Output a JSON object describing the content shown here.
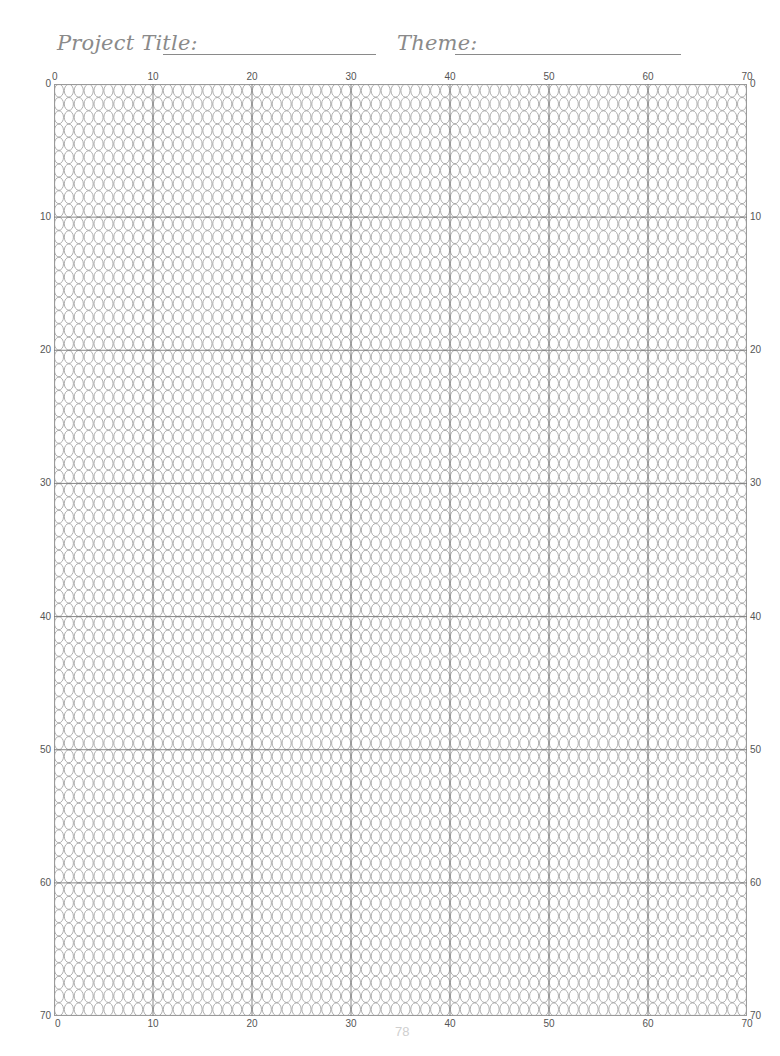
{
  "header": {
    "project_title_label": "Project Title:",
    "theme_label": "Theme:"
  },
  "grid": {
    "columns": 70,
    "rows": 70,
    "major_every": 10,
    "cell_shape": "oval",
    "line_color": "#9a9a9a",
    "major_line_color": "#7a7a7a"
  },
  "axes": {
    "top": [
      "0",
      "10",
      "20",
      "30",
      "40",
      "50",
      "60",
      "70"
    ],
    "bottom": [
      "0",
      "10",
      "20",
      "30",
      "40",
      "50",
      "60",
      "70"
    ],
    "left": [
      "0",
      "10",
      "20",
      "30",
      "40",
      "50",
      "60",
      "70"
    ],
    "right": [
      "0",
      "10",
      "20",
      "30",
      "40",
      "50",
      "60",
      "70"
    ]
  },
  "footer": {
    "page_number": "78"
  },
  "colors": {
    "header_text": "#8a8a8a",
    "axis_text": "#555555",
    "page_number": "#cfcfcf"
  }
}
